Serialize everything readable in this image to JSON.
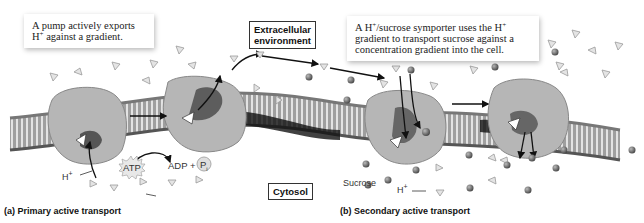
{
  "callouts": {
    "primary": {
      "line1": "A pump actively exports",
      "line2_prefix": "H",
      "line2_sup": "+",
      "line2_rest": " against a gradient."
    },
    "secondary": {
      "l1a": "A H",
      "l1sup": "+",
      "l1b": "/sucrose symporter uses the H",
      "l1sup2": "+",
      "line2": "gradient to transport sucrose against a",
      "line3": "concentration gradient into the cell."
    }
  },
  "regions": {
    "extracellular_line1": "Extracellular",
    "extracellular_line2": "environment",
    "cytosol": "Cytosol"
  },
  "labels": {
    "atp": "ATP",
    "adp_plus": "ADP +",
    "pi": "P",
    "pi_sub": "i",
    "h_plus_left": "H",
    "h_plus_left_sup": "+",
    "sucrose": "Sucrose",
    "h_plus_right": "H",
    "h_plus_right_sup": "+"
  },
  "captions": {
    "a": "(a) Primary active transport",
    "b": "(b) Secondary active transport"
  },
  "colors": {
    "protein": "#b8b8b8",
    "protein_dark": "#6a6a6a",
    "membrane": "#8a8a8a",
    "sucrose": "#6e6e6e",
    "h_ion": "#d8d8d8"
  }
}
